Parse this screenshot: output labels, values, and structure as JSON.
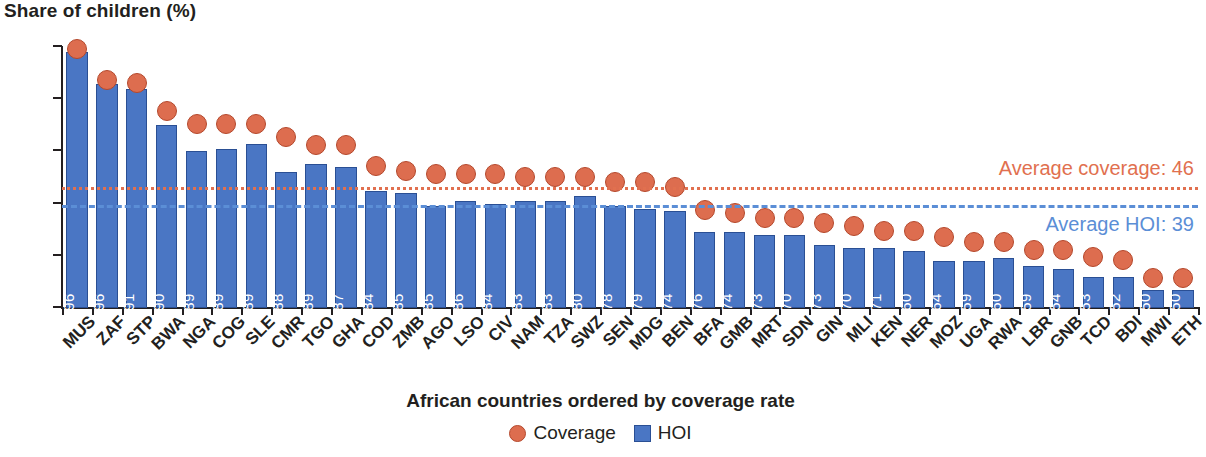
{
  "chart_data": {
    "type": "bar",
    "title": "Share of children (%)",
    "ylabel": "Share of children (%)",
    "xlabel": "African countries ordered by coverage rate",
    "ylim": [
      0,
      100
    ],
    "yticks": [
      0,
      20,
      40,
      60,
      80,
      100
    ],
    "grid": false,
    "legend_position": "bottom",
    "legend": [
      "Coverage",
      "HOI"
    ],
    "categories": [
      "MUS",
      "ZAF",
      "STP",
      "BWA",
      "NGA",
      "COG",
      "SLE",
      "CMR",
      "TGO",
      "GHA",
      "COD",
      "ZMB",
      "AGO",
      "LSO",
      "CIV",
      "NAM",
      "TZA",
      "SWZ",
      "SEN",
      "MDG",
      "BEN",
      "BFA",
      "GMB",
      "MRT",
      "SDN",
      "GIN",
      "MLI",
      "KEN",
      "NER",
      "MOZ",
      "UGA",
      "RWA",
      "LBR",
      "GNB",
      "TCD",
      "BDI",
      "MWI",
      "ETH"
    ],
    "series": [
      {
        "name": "Coverage",
        "type": "scatter",
        "color": "#dd6d4f",
        "values": [
          99,
          87,
          86,
          75,
          70,
          70,
          70,
          65,
          62,
          62,
          54,
          52,
          51,
          51,
          51,
          50,
          50,
          50,
          48,
          48,
          46,
          37,
          36,
          34,
          34,
          32,
          31,
          29,
          29,
          27,
          25,
          25,
          22,
          22,
          19,
          18,
          11,
          11
        ]
      },
      {
        "name": "HOI",
        "type": "bar",
        "color": "#4a76c4",
        "values": [
          98,
          86,
          84,
          70,
          60,
          61,
          63,
          52,
          55,
          54,
          45,
          44,
          39,
          41,
          40,
          41,
          41,
          43,
          39,
          38,
          37,
          29,
          29,
          28,
          28,
          24,
          23,
          23,
          22,
          18,
          18,
          19,
          16,
          15,
          12,
          12,
          7,
          7
        ]
      }
    ],
    "bar_labels": [
      "96",
      "96",
      "91",
      "90",
      "89",
      "89",
      "89",
      "88",
      "89",
      "87",
      "84",
      "85",
      "85",
      "86",
      "84",
      "83",
      "83",
      "80",
      "78",
      "79",
      "74",
      "76",
      "74",
      "73",
      "70",
      "73",
      "70",
      "71",
      "60",
      "64",
      "59",
      "60",
      "59",
      "54",
      "53",
      "52",
      "50",
      "50"
    ],
    "annotations": [
      {
        "name": "average-coverage",
        "label": "Average coverage: 46",
        "value": 46,
        "color": "#e1704f",
        "style": "dotted"
      },
      {
        "name": "average-hoi",
        "label": "Average HOI: 39",
        "value": 39,
        "color": "#5b8ed6",
        "style": "dashed"
      }
    ]
  }
}
